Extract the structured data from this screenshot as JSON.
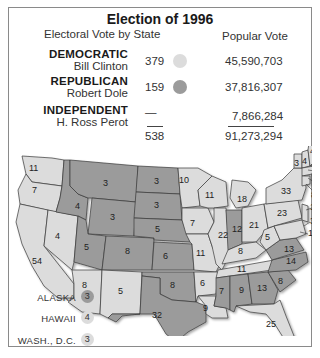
{
  "title": "Election of 1996",
  "headers": {
    "electoral": "Electoral Vote by State",
    "popular": "Popular Vote"
  },
  "colors": {
    "democratic": "#dcdcdc",
    "republican": "#9b9b9b",
    "border": "#3a3a3a"
  },
  "parties": [
    {
      "party": "DEMOCRATIC",
      "candidate": "Bill Clinton",
      "electoral_votes": "379",
      "popular_vote": "45,590,703",
      "color": "#dcdcdc"
    },
    {
      "party": "REPUBLICAN",
      "candidate": "Robert Dole",
      "electoral_votes": "159",
      "popular_vote": "37,816,307",
      "color": "#9b9b9b"
    },
    {
      "party": "INDEPENDENT",
      "candidate": "H. Ross Perot",
      "electoral_votes": "—",
      "popular_vote": "7,866,284",
      "color": null
    }
  ],
  "totals": {
    "electoral_votes": "538",
    "popular_vote": "91,273,294"
  },
  "insets": [
    {
      "label": "ALASKA",
      "votes": "3",
      "winner": "republican"
    },
    {
      "label": "HAWAII",
      "votes": "4",
      "winner": "democratic"
    },
    {
      "label": "WASH., D.C.",
      "votes": "3",
      "winner": "democratic"
    }
  ],
  "states": [
    {
      "name": "Washington",
      "votes": "11",
      "winner": "democratic"
    },
    {
      "name": "Oregon",
      "votes": "7",
      "winner": "democratic"
    },
    {
      "name": "California",
      "votes": "54",
      "winner": "democratic"
    },
    {
      "name": "Nevada",
      "votes": "4",
      "winner": "democratic"
    },
    {
      "name": "Idaho",
      "votes": "4",
      "winner": "republican"
    },
    {
      "name": "Montana",
      "votes": "3",
      "winner": "republican"
    },
    {
      "name": "Wyoming",
      "votes": "3",
      "winner": "republican"
    },
    {
      "name": "Utah",
      "votes": "5",
      "winner": "republican"
    },
    {
      "name": "Colorado",
      "votes": "8",
      "winner": "republican"
    },
    {
      "name": "Arizona",
      "votes": "8",
      "winner": "democratic"
    },
    {
      "name": "New Mexico",
      "votes": "5",
      "winner": "democratic"
    },
    {
      "name": "North Dakota",
      "votes": "3",
      "winner": "republican"
    },
    {
      "name": "South Dakota",
      "votes": "3",
      "winner": "republican"
    },
    {
      "name": "Nebraska",
      "votes": "5",
      "winner": "republican"
    },
    {
      "name": "Kansas",
      "votes": "6",
      "winner": "republican"
    },
    {
      "name": "Oklahoma",
      "votes": "8",
      "winner": "republican"
    },
    {
      "name": "Texas",
      "votes": "32",
      "winner": "republican"
    },
    {
      "name": "Minnesota",
      "votes": "10",
      "winner": "democratic"
    },
    {
      "name": "Iowa",
      "votes": "7",
      "winner": "democratic"
    },
    {
      "name": "Missouri",
      "votes": "11",
      "winner": "democratic"
    },
    {
      "name": "Arkansas",
      "votes": "6",
      "winner": "democratic"
    },
    {
      "name": "Louisiana",
      "votes": "9",
      "winner": "democratic"
    },
    {
      "name": "Wisconsin",
      "votes": "11",
      "winner": "democratic"
    },
    {
      "name": "Illinois",
      "votes": "22",
      "winner": "democratic"
    },
    {
      "name": "Michigan",
      "votes": "18",
      "winner": "democratic"
    },
    {
      "name": "Indiana",
      "votes": "12",
      "winner": "republican"
    },
    {
      "name": "Ohio",
      "votes": "21",
      "winner": "democratic"
    },
    {
      "name": "Kentucky",
      "votes": "8",
      "winner": "democratic"
    },
    {
      "name": "Tennessee",
      "votes": "11",
      "winner": "democratic"
    },
    {
      "name": "Mississippi",
      "votes": "7",
      "winner": "republican"
    },
    {
      "name": "Alabama",
      "votes": "9",
      "winner": "republican"
    },
    {
      "name": "Georgia",
      "votes": "13",
      "winner": "republican"
    },
    {
      "name": "Florida",
      "votes": "25",
      "winner": "democratic"
    },
    {
      "name": "South Carolina",
      "votes": "8",
      "winner": "republican"
    },
    {
      "name": "North Carolina",
      "votes": "14",
      "winner": "republican"
    },
    {
      "name": "Virginia",
      "votes": "13",
      "winner": "republican"
    },
    {
      "name": "West Virginia",
      "votes": "5",
      "winner": "democratic"
    },
    {
      "name": "Pennsylvania",
      "votes": "23",
      "winner": "democratic"
    },
    {
      "name": "New York",
      "votes": "33",
      "winner": "democratic"
    },
    {
      "name": "Vermont",
      "votes": "3",
      "winner": "democratic"
    },
    {
      "name": "New Hampshire",
      "votes": "4",
      "winner": "democratic"
    },
    {
      "name": "Maine",
      "votes": "4",
      "winner": "democratic"
    },
    {
      "name": "Massachusetts",
      "votes": "12",
      "winner": "democratic"
    },
    {
      "name": "Rhode Island",
      "votes": "4",
      "winner": "democratic"
    },
    {
      "name": "Connecticut",
      "votes": "8",
      "winner": "democratic"
    },
    {
      "name": "New Jersey",
      "votes": "15",
      "winner": "democratic"
    },
    {
      "name": "Delaware",
      "votes": "3",
      "winner": "democratic"
    },
    {
      "name": "Maryland",
      "votes": "10",
      "winner": "democratic"
    }
  ]
}
